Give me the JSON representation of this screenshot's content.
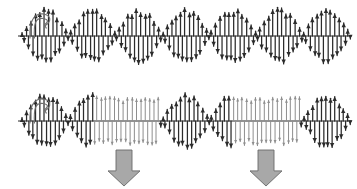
{
  "figure": {
    "background_color": "#ffffff",
    "width": 357,
    "height": 189
  },
  "palette": {
    "dark_stroke": "#2b2b2b",
    "light_stroke": "#8e8e8e",
    "hook_stroke": "#6f6f6f",
    "block_arrow_fill": "#a8a8a8",
    "block_arrow_stroke": "#6a6a6a"
  },
  "chart_data": {
    "type": "line",
    "subtitle": "",
    "xlabel": "",
    "ylabel": "",
    "grid": false,
    "legend_position": "none",
    "xlim": [
      0,
      357
    ],
    "panels": [
      {
        "id": "panel-top",
        "name": "undistorted-modulated-wave",
        "label": "",
        "baseline_y": 36,
        "x_start": 22,
        "x_end": 350,
        "quill_count": 150,
        "carrier_cycles": 75,
        "envelope": {
          "type": "sinusoidal-beat",
          "beats": 7.0,
          "peak_amplitude": 27,
          "min_amplitude": 3.5,
          "clipped": false,
          "clip_level": null
        },
        "arrowheads": "double",
        "stroke_role": "dark"
      },
      {
        "id": "panel-bottom",
        "name": "clipped-modulated-wave",
        "label": "",
        "baseline_y": 121,
        "x_start": 22,
        "x_end": 350,
        "quill_count": 150,
        "carrier_cycles": 75,
        "envelope": {
          "type": "sinusoidal-beat-clipped",
          "beats": 7.0,
          "peak_amplitude": 27,
          "min_amplitude": 3.5,
          "clipped": true,
          "clip_level": 23
        },
        "arrowheads": "double",
        "stroke_role": "dark-with-light-plateaus"
      }
    ],
    "annotations": [
      {
        "id": "hook-top",
        "name": "curved-hook-top",
        "kind": "curved-arrow",
        "panel": "panel-top",
        "x": 30,
        "y": 12,
        "width": 22,
        "height": 26
      },
      {
        "id": "hook-bottom",
        "name": "curved-hook-bottom",
        "kind": "curved-arrow",
        "panel": "panel-bottom",
        "x": 30,
        "y": 97,
        "width": 22,
        "height": 26
      },
      {
        "id": "down-arrow-1",
        "name": "block-down-arrow-left",
        "kind": "block-arrow-down",
        "points_to": "plateau-1",
        "center_x": 124,
        "top_y": 150,
        "bottom_y": 186,
        "shaft_width": 16,
        "head_width": 32
      },
      {
        "id": "down-arrow-2",
        "name": "block-down-arrow-right",
        "kind": "block-arrow-down",
        "points_to": "plateau-2",
        "center_x": 266,
        "top_y": 150,
        "bottom_y": 186,
        "shaft_width": 16,
        "head_width": 32
      }
    ],
    "plateaus": [
      {
        "id": "plateau-1",
        "panel": "panel-bottom",
        "x_start": 93,
        "x_end": 160,
        "level": 23
      },
      {
        "id": "plateau-2",
        "panel": "panel-bottom",
        "x_start": 232,
        "x_end": 300,
        "level": 23
      }
    ]
  }
}
